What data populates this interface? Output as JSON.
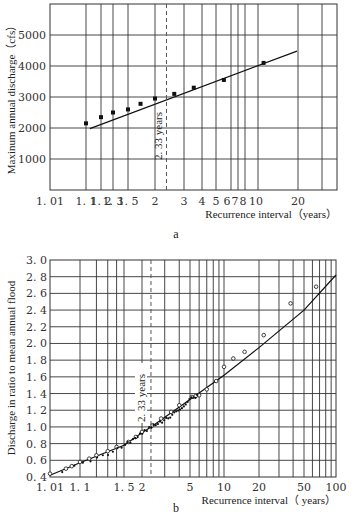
{
  "figure": {
    "caption": "Fig. 4-11",
    "panel_a_label": "a",
    "panel_b_label": "b"
  },
  "chart_data": [
    {
      "type": "scatter",
      "panel": "a",
      "title": "",
      "xlabel": "Recurrence interval（years）",
      "ylabel": "Maxinum annual discharge（cfs）",
      "xscale": "gumbel-probability",
      "x_ticks": [
        "1. 01",
        "1. 1",
        "1. 2",
        "1. 3",
        "1. 5",
        "2",
        "3",
        "4",
        "5",
        "6",
        "7",
        "8",
        "10",
        "20"
      ],
      "x_tick_values": [
        1.01,
        1.1,
        1.2,
        1.3,
        1.5,
        2,
        3,
        4,
        5,
        6,
        7,
        8,
        10,
        20
      ],
      "y_ticks": [
        "1000",
        "2000",
        "3000",
        "4000",
        "5000"
      ],
      "ylim": [
        0,
        6000
      ],
      "grid": true,
      "annotation": "2. 33 years",
      "annotation_x": 2.33,
      "series": [
        {
          "name": "observed",
          "marker": "filled-square",
          "x": [
            1.1,
            1.2,
            1.3,
            1.5,
            1.7,
            2.0,
            2.6,
            3.5,
            5.5,
            11
          ],
          "y": [
            2150,
            2350,
            2500,
            2600,
            2780,
            2950,
            3100,
            3300,
            3550,
            4100
          ]
        },
        {
          "name": "fitted line",
          "type": "line",
          "x": [
            1.05,
            30
          ],
          "y": [
            1980,
            4480
          ]
        }
      ]
    },
    {
      "type": "scatter",
      "panel": "b",
      "title": "",
      "xlabel": "Recurrence interval（ years）",
      "ylabel": "Discharge in ratio to mean annual flood",
      "xscale": "gumbel-probability",
      "x_ticks": [
        "1. 01",
        "1. 1",
        "1. 5",
        "2",
        "5",
        "10",
        "20",
        "50",
        "100"
      ],
      "x_tick_values": [
        1.01,
        1.1,
        1.5,
        2,
        5,
        10,
        20,
        50,
        100
      ],
      "y_ticks": [
        "0. 4",
        "0. 6",
        "0. 8",
        "1. 0",
        "1. 2",
        "1. 4",
        "1. 6",
        "1. 8",
        "2. 0",
        "2. 2",
        "2. 4",
        "2. 6",
        "2. 8",
        "3. 0"
      ],
      "ylim": [
        0.4,
        3.0
      ],
      "grid": true,
      "annotation": "2. 33 years",
      "annotation_x": 2.33,
      "series": [
        {
          "name": "observed",
          "marker": "open-circle",
          "x": [
            1.01,
            1.04,
            1.06,
            1.1,
            1.15,
            1.2,
            1.3,
            1.4,
            1.6,
            1.8,
            2.0,
            2.4,
            2.8,
            3.4,
            4.0,
            5.2,
            5.6,
            6.0,
            7.0,
            8.5,
            10,
            12,
            15,
            22,
            38,
            65
          ],
          "y": [
            0.44,
            0.5,
            0.53,
            0.58,
            0.62,
            0.66,
            0.71,
            0.76,
            0.82,
            0.88,
            0.94,
            1.02,
            1.1,
            1.18,
            1.26,
            1.36,
            1.37,
            1.38,
            1.45,
            1.55,
            1.72,
            1.82,
            1.9,
            2.1,
            2.48,
            2.68
          ]
        },
        {
          "name": "fitted line",
          "type": "line",
          "x": [
            1.01,
            1.1,
            1.5,
            2,
            2.33,
            5,
            10,
            20,
            50,
            100
          ],
          "y": [
            0.42,
            0.57,
            0.78,
            0.93,
            1.0,
            1.33,
            1.62,
            1.95,
            2.4,
            2.82
          ]
        }
      ]
    }
  ]
}
